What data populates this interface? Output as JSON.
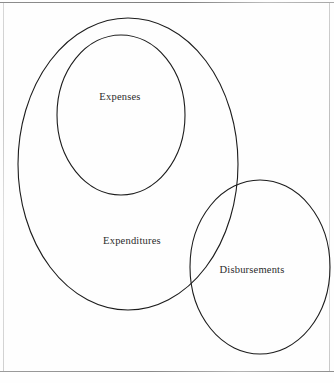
{
  "page": {
    "background_color": "#fefefe",
    "border_color": "#9a9a9a",
    "width": 334,
    "height": 383
  },
  "diagram": {
    "type": "euler-diagram",
    "stroke_color": "#1c1c1c",
    "stroke_width": 1.1,
    "fill": "none",
    "sets": [
      {
        "id": "expenditures",
        "label": "Expenditures",
        "shape": "ellipse",
        "cx": 128,
        "cy": 164,
        "rx": 110,
        "ry": 146,
        "label_x": 132,
        "label_y": 240
      },
      {
        "id": "expenses",
        "label": "Expenses",
        "shape": "ellipse",
        "cx": 121,
        "cy": 115,
        "rx": 64,
        "ry": 80,
        "label_x": 120,
        "label_y": 96
      },
      {
        "id": "disbursements",
        "label": "Disbursements",
        "shape": "ellipse",
        "cx": 260,
        "cy": 267,
        "rx": 70,
        "ry": 87,
        "label_x": 252,
        "label_y": 269
      }
    ],
    "relations": [
      {
        "kind": "subset",
        "inner": "expenses",
        "outer": "expenditures"
      },
      {
        "kind": "overlap",
        "a": "expenditures",
        "b": "disbursements"
      }
    ]
  }
}
